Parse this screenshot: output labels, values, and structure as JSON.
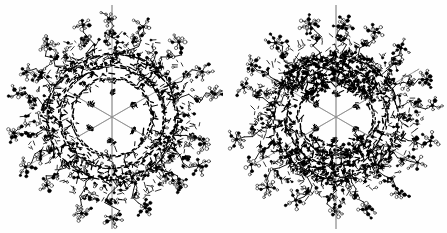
{
  "figure": {
    "background_color": "#fefefe",
    "structure_color": "#000000",
    "axis_line_color": "#8c8c8c",
    "width": 447,
    "height": 233,
    "caption": ""
  },
  "panels": [
    {
      "id": "left",
      "label": "left-molecule",
      "description": "Ball-and-stick wireframe of a six-fold symmetric dendritic molecule viewed down the principal axis",
      "center_x": 112,
      "center_y": 117,
      "core_radius": 34,
      "shell_radius": 72,
      "arm_radius": 104,
      "symmetry_order": 6,
      "axis_lines": [
        {
          "name": "vertical-axis",
          "angle_deg": 90,
          "length": 112
        },
        {
          "name": "diagonal-axis-1",
          "angle_deg": 30,
          "length": 98
        },
        {
          "name": "diagonal-axis-2",
          "angle_deg": 150,
          "length": 98
        }
      ],
      "density_seed": 11,
      "shell_density": 1.0,
      "core_star": true
    },
    {
      "id": "right",
      "label": "right-molecule",
      "description": "Ball-and-stick wireframe of the same molecule in a rotated orientation showing an open hexagonal core",
      "center_x": 112,
      "center_y": 117,
      "core_radius": 32,
      "shell_radius": 70,
      "arm_radius": 102,
      "symmetry_order": 6,
      "axis_lines": [
        {
          "name": "vertical-axis",
          "angle_deg": 90,
          "length": 112
        },
        {
          "name": "diagonal-axis-1",
          "angle_deg": 30,
          "length": 96
        },
        {
          "name": "diagonal-axis-2",
          "angle_deg": 150,
          "length": 96
        }
      ],
      "density_seed": 73,
      "shell_density": 0.9,
      "core_star": true
    }
  ],
  "chart_data": {
    "type": "scatter",
    "xlabel": "",
    "ylabel": "",
    "series": [
      {
        "name": "left-molecule",
        "atoms": 1180,
        "bonds": 1420
      },
      {
        "name": "right-molecule",
        "atoms": 1180,
        "bonds": 1420
      }
    ]
  }
}
